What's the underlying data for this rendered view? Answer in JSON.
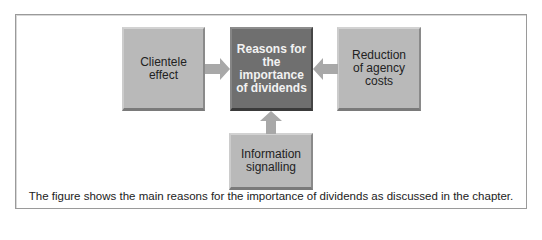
{
  "diagram": {
    "center": {
      "label": "Reasons for the importance of dividends"
    },
    "left": {
      "label": "Clientele effect"
    },
    "right": {
      "label": "Reduction of agency costs"
    },
    "bottom": {
      "label": "Information signalling"
    },
    "caption": "The figure shows the main reasons for the importance of dividends as discussed in the chapter.",
    "colors": {
      "outer_box": "#b9b9b9",
      "center_box": "#6f6f6f",
      "arrow": "#a8a8a8",
      "frame_border": "#9a9a9a"
    }
  }
}
